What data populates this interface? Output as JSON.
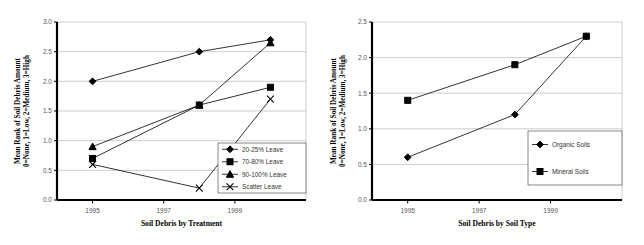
{
  "chart_data": [
    {
      "type": "line",
      "title": "Soil Debris by Treatment",
      "xlabel": "Soil Debris by Treatment",
      "ylabel": "Mean Rank of Soil Debris Amount 0=None, 1=Low, 2=Medium, 3=High",
      "ylabel_line1": "Mean Rank of Soil Debris Amount",
      "ylabel_line2": "0=None, 1=Low, 2=Medium, 3=High",
      "x": [
        1995,
        1998,
        2000
      ],
      "xtick_labels": [
        "1995",
        "1997",
        "1999"
      ],
      "xtick_values": [
        1995,
        1997,
        1999
      ],
      "xlim": [
        1994,
        2001
      ],
      "ylim": [
        0.0,
        3.0
      ],
      "ytick_labels": [
        "0.0",
        "0.5",
        "1.0",
        "1.5",
        "2.0",
        "2.5",
        "3.0"
      ],
      "ytick_values": [
        0.0,
        0.5,
        1.0,
        1.5,
        2.0,
        2.5,
        3.0
      ],
      "grid": true,
      "legend_position": "bottom-right",
      "series": [
        {
          "name": "20-25% Leave",
          "marker": "diamond",
          "values": [
            2.0,
            2.5,
            2.7
          ]
        },
        {
          "name": "70-80% Leave",
          "marker": "square",
          "values": [
            0.7,
            1.6,
            1.9
          ]
        },
        {
          "name": "90-100% Leave",
          "marker": "triangle",
          "values": [
            0.9,
            1.6,
            2.65
          ]
        },
        {
          "name": "Scatter Leave",
          "marker": "x",
          "values": [
            0.6,
            0.2,
            1.7
          ]
        }
      ]
    },
    {
      "type": "line",
      "title": "Soil Debris by Soil Type",
      "xlabel": "Soil Debris by Soil Type",
      "ylabel": "Mean Rank of Soil Debris Amount 0=None, 1=Low, 2=Medium, 3=High",
      "ylabel_line1": "Mean Rank of Soil Debris Amount",
      "ylabel_line2": "0=None, 1=Low, 2=Medium, 3=High",
      "x": [
        1995,
        1998,
        2000
      ],
      "xtick_labels": [
        "1995",
        "1997",
        "1999"
      ],
      "xtick_values": [
        1995,
        1997,
        1999
      ],
      "xlim": [
        1994,
        2001
      ],
      "ylim": [
        0.0,
        2.5
      ],
      "ytick_labels": [
        "0.0",
        "0.5",
        "1.0",
        "1.5",
        "2.0",
        "2.5"
      ],
      "ytick_values": [
        0.0,
        0.5,
        1.0,
        1.5,
        2.0,
        2.5
      ],
      "grid": true,
      "legend_position": "bottom-right",
      "series": [
        {
          "name": "Organic Soils",
          "marker": "diamond",
          "values": [
            0.6,
            1.2,
            2.3
          ]
        },
        {
          "name": "Mineral Soils",
          "marker": "square",
          "values": [
            1.4,
            1.9,
            2.3
          ]
        }
      ]
    }
  ],
  "colors": {
    "background": "#ffffff",
    "axis": "#000000",
    "gridline": "#b8b8b8",
    "series": "#000000",
    "tick_label": "#555555",
    "legend_border": "#555555"
  },
  "layout": {
    "left_legend_box": {
      "x": 218,
      "y": 143,
      "w": 88,
      "h": 50
    },
    "right_legend_box": {
      "x": 528,
      "y": 131,
      "w": 94,
      "h": 54
    }
  }
}
